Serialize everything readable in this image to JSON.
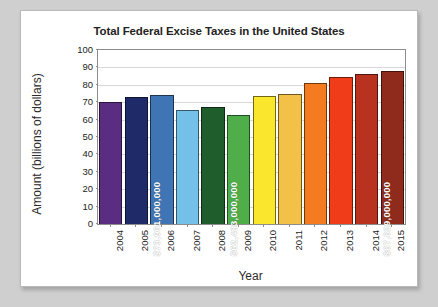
{
  "chart_data": {
    "type": "bar",
    "title": "Total Federal Excise Taxes in the United States",
    "xlabel": "Year",
    "ylabel": "Amount (billions of dollars)",
    "categories": [
      "2004",
      "2005",
      "2006",
      "2007",
      "2008",
      "2009",
      "2010",
      "2011",
      "2012",
      "2013",
      "2014",
      "2015"
    ],
    "values": [
      70.0,
      73.0,
      73.961,
      65.5,
      67.5,
      62.483,
      73.5,
      74.5,
      81.0,
      84.5,
      86.0,
      87.829
    ],
    "ylim": [
      0,
      100
    ],
    "ytick_labels": [
      "0",
      "10",
      "20",
      "30",
      "40",
      "50",
      "60",
      "70",
      "80",
      "90",
      "100"
    ],
    "yticks": [
      0,
      10,
      20,
      30,
      40,
      50,
      60,
      70,
      80,
      90,
      100
    ],
    "grid": true,
    "legend": "none",
    "bar_colors": [
      "#5b2d82",
      "#1f2a68",
      "#3f74b5",
      "#73c0e8",
      "#1f5e2c",
      "#4fae4a",
      "#fbe62e",
      "#f3c148",
      "#f47b20",
      "#f03c18",
      "#b8321f",
      "#8f2b1c"
    ],
    "annotations": [
      {
        "category": "2006",
        "text": "$73,961,000,000"
      },
      {
        "category": "2009",
        "text": "$62,483,000,000"
      },
      {
        "category": "2015",
        "text": "$87,829,000,000"
      }
    ],
    "data_labels": [
      null,
      null,
      "$73,961,000,000",
      null,
      null,
      "$62,483,000,000",
      null,
      null,
      null,
      null,
      null,
      "$87,829,000,000"
    ]
  }
}
